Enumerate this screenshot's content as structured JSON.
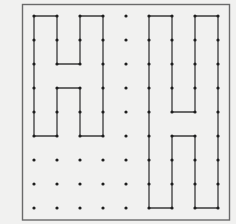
{
  "canvas": {
    "width": 236,
    "height": 224,
    "background": "#f1f1f0"
  },
  "frame": {
    "x": 22.5,
    "y": 4.5,
    "width": 207,
    "height": 215.5,
    "stroke": "#6a6a6a",
    "stroke_width": 1.4
  },
  "grid": {
    "cols": 9,
    "rows": 9,
    "col_x": [
      34,
      57,
      80,
      103,
      126,
      149,
      172,
      195,
      218
    ],
    "row_y": [
      16,
      40,
      64,
      88,
      112,
      136,
      160,
      184,
      208
    ],
    "dot_color": "#1e1e1e",
    "dot_radius": 1.6
  },
  "shapes": [
    {
      "name": "left-h-shape",
      "stroke": "#3a3a3a",
      "points": [
        [
          0,
          0
        ],
        [
          1,
          0
        ],
        [
          1,
          2
        ],
        [
          2,
          2
        ],
        [
          2,
          0
        ],
        [
          3,
          0
        ],
        [
          3,
          5
        ],
        [
          2,
          5
        ],
        [
          2,
          3
        ],
        [
          1,
          3
        ],
        [
          1,
          5
        ],
        [
          0,
          5
        ]
      ]
    },
    {
      "name": "right-h-shape",
      "stroke": "#3a3a3a",
      "points": [
        [
          5,
          0
        ],
        [
          6,
          0
        ],
        [
          6,
          4
        ],
        [
          7,
          4
        ],
        [
          7,
          0
        ],
        [
          8,
          0
        ],
        [
          8,
          8
        ],
        [
          7,
          8
        ],
        [
          7,
          5
        ],
        [
          6,
          5
        ],
        [
          6,
          8
        ],
        [
          5,
          8
        ]
      ]
    }
  ]
}
